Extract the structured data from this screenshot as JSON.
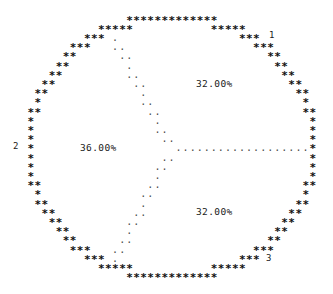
{
  "figure": {
    "title": "",
    "background_color": "#ffffff",
    "foreground_color": "#000000",
    "perimeter_glyph": "*",
    "radius_glyph": ".",
    "width": 333,
    "height": 294
  },
  "labels": {
    "slice_1_percent": "32.00%",
    "slice_2_percent": "36.00%",
    "slice_3_percent": "32.00%",
    "slice_1_key": "1",
    "slice_2_key": "2",
    "slice_3_key": "3"
  },
  "chart_data": {
    "type": "pie",
    "title": "",
    "categories": [
      "1",
      "2",
      "3"
    ],
    "values": [
      32.0,
      36.0,
      32.0
    ],
    "value_labels": [
      "32.00%",
      "36.00%",
      "32.00%"
    ],
    "units": "percent",
    "total": 100.0,
    "legend": "none",
    "legend_position": "outside-perimeter",
    "grid": false,
    "start_angle_deg": 0,
    "direction": "counterclockwise",
    "slices": [
      {
        "name": "1",
        "value": 32.0,
        "label": "32.00%",
        "start_angle_deg": 0,
        "end_angle_deg": 115.2,
        "key_label": "1",
        "label_position": "upper-right"
      },
      {
        "name": "2",
        "value": 36.0,
        "label": "36.00%",
        "start_angle_deg": 115.2,
        "end_angle_deg": 244.8,
        "key_label": "2",
        "label_position": "left"
      },
      {
        "name": "3",
        "value": 32.0,
        "label": "32.00%",
        "start_angle_deg": 244.8,
        "end_angle_deg": 360.0,
        "key_label": "3",
        "label_position": "lower-right"
      }
    ]
  }
}
